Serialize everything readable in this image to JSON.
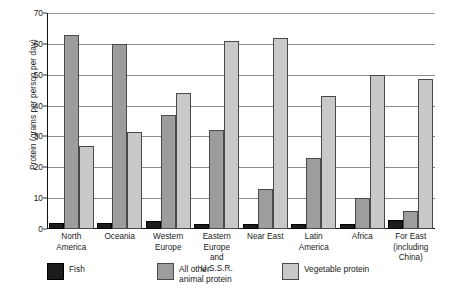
{
  "chart_data": {
    "type": "bar",
    "title": "",
    "xlabel": "",
    "ylabel": "Protein (grams per person per day)",
    "ylim": [
      0,
      70
    ],
    "ytick_step": 10,
    "yticks": [
      0,
      10,
      20,
      30,
      40,
      50,
      60,
      70
    ],
    "grid": true,
    "legend_position": "bottom",
    "categories": [
      "North America",
      "Oceania",
      "Western Europe",
      "Eastern Europe and U.S.S.R.",
      "Near East",
      "Latin America",
      "Africa",
      "For East (including China)"
    ],
    "category_lines": [
      [
        "North",
        "America"
      ],
      [
        "Oceania"
      ],
      [
        "Western",
        "Europe"
      ],
      [
        "Eastern",
        "Europe",
        "and U.S.S.R."
      ],
      [
        "Near East"
      ],
      [
        "Latin",
        "America"
      ],
      [
        "Africa"
      ],
      [
        "For East",
        "(including",
        "China)"
      ]
    ],
    "series": [
      {
        "name": "Fish",
        "color": "#1c1c1c",
        "values": [
          2,
          2,
          2.5,
          1.5,
          1.5,
          1.5,
          1.5,
          3
        ]
      },
      {
        "name": "All other animal protein",
        "color": "#9d9d9d",
        "values": [
          63,
          60,
          37,
          32,
          13,
          23,
          10,
          6
        ]
      },
      {
        "name": "Vegetable protein",
        "color": "#c9c9c9",
        "values": [
          27,
          31.5,
          44,
          61,
          62,
          43,
          50,
          48.5
        ]
      }
    ],
    "legend_labels": [
      "Fish",
      "All other animal protein",
      "Vegetable protein"
    ],
    "legend_label_lines": [
      [
        "Fish"
      ],
      [
        "All other",
        "animal protein"
      ],
      [
        "Vegetable protein"
      ]
    ]
  }
}
